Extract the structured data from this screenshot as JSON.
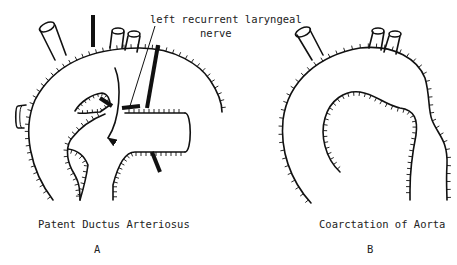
{
  "figure": {
    "panels": [
      {
        "id": "A",
        "letter": "A",
        "caption": "Patent Ductus Arteriosus",
        "annotation": {
          "line1": "left recurrent laryngeal",
          "line2": "nerve"
        }
      },
      {
        "id": "B",
        "letter": "B",
        "caption": "Coarctation of Aorta"
      }
    ],
    "colors": {
      "ink": "#111111",
      "background": "#ffffff"
    }
  }
}
